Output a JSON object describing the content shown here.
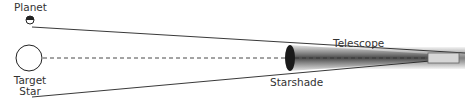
{
  "labels": {
    "planet": "Planet",
    "target_star_line1": "Target",
    "target_star_line2": "Star",
    "telescope": "Telescope",
    "starshade": "Starshade"
  },
  "colors": {
    "line": "#222222",
    "starshade": "#1a1a1a",
    "shadow_dark": "#3a3a3a",
    "shadow_light": "#e8e8e8",
    "telescope_tube": "#d9d9d9",
    "label": "#333333"
  }
}
